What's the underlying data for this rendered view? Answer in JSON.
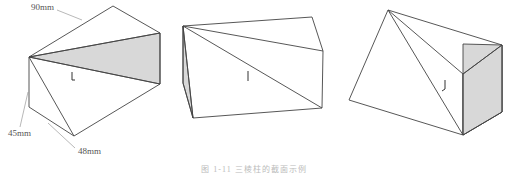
{
  "figure": {
    "caption": "图 1-11  三棱柱的截面示例",
    "dimensions": [
      "90mm",
      "45mm",
      "48mm"
    ],
    "shade_color": "#d8d8d8",
    "line_color": "#444444",
    "views": [
      {
        "name": "view-1",
        "shaded_face": "triangular-section"
      },
      {
        "name": "view-2",
        "shaded_face": "left-end-face"
      },
      {
        "name": "view-3",
        "shaded_face": "right-end-face"
      }
    ]
  }
}
